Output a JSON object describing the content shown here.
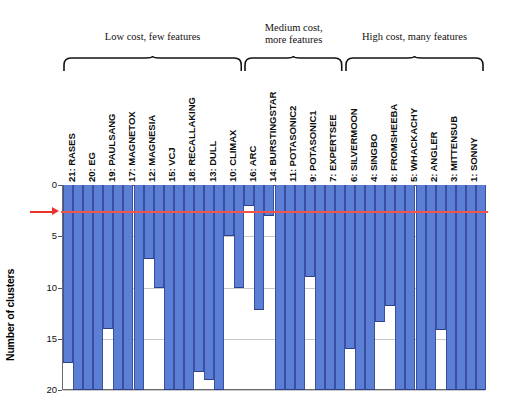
{
  "axis": {
    "y_title": "Number of clusters",
    "y_ticks": [
      "0",
      "5",
      "10",
      "15",
      "20"
    ],
    "y_min": 0,
    "y_max": 20
  },
  "groups": [
    {
      "label": "Low cost, few features",
      "start_index": 0,
      "end_index": 8
    },
    {
      "label": "Medium cost,\nmore features",
      "start_index": 9,
      "end_index": 13
    },
    {
      "label": "High cost, many features",
      "start_index": 14,
      "end_index": 20
    }
  ],
  "annotations": {
    "threshold_value": 2.5,
    "threshold_color": "#f0544a",
    "arrow_color": "#e8322a",
    "bar_color": "#5b7fd4",
    "bar_edge_color": "#3a4fa0"
  },
  "chart_data": {
    "type": "bar",
    "title": "",
    "xlabel": "",
    "ylabel": "Number of clusters",
    "ylim": [
      0,
      20
    ],
    "y_inverted": true,
    "grid": true,
    "legend": "none",
    "yticks": [
      0,
      5,
      10,
      15,
      20
    ],
    "threshold_line": 2.5,
    "categories": [
      "21: RASES",
      "20: EG",
      "19: PAULSANG",
      "17: MAGNETOX",
      "12: MAGNESIA",
      "15: VCJ",
      "18: RECALLAKING",
      "13: DULL",
      "10: CLIMAX",
      "16: ARC",
      "14: BURSTINGSTAR",
      "11: POTASONIC2",
      "9: POTASONIC1",
      "7: EXPERTSEE",
      "6: SILVERMOON",
      "4: SINGBO",
      "8: FROMSHEEBA",
      "5: WHACKACHY",
      "2: ANGLER",
      "3: MITTENSUB",
      "1: SONNY"
    ],
    "values": [
      [
        17.4,
        20.0
      ],
      [
        20.0,
        20.0
      ],
      [
        14.0,
        20.0
      ],
      [
        20.0,
        20.0
      ],
      [
        7.2,
        10.0
      ],
      [
        20.0,
        20.0
      ],
      [
        20.0,
        18.2
      ],
      [
        19.0,
        20.0
      ],
      [
        5.0,
        10.0
      ],
      [
        2.0,
        12.2
      ],
      [
        3.0,
        20.0
      ],
      [
        20.0,
        20.0
      ],
      [
        9.0,
        20.0
      ],
      [
        20.0,
        20.0
      ],
      [
        16.0,
        20.0
      ],
      [
        20.0,
        13.4
      ],
      [
        11.8,
        20.0
      ],
      [
        20.0,
        20.0
      ],
      [
        20.0,
        14.1
      ],
      [
        20.0,
        20.0
      ],
      [
        20.0,
        20.0
      ]
    ],
    "series": [
      {
        "name": "bar-a",
        "values": [
          17.4,
          20.0,
          14.0,
          20.0,
          7.2,
          20.0,
          20.0,
          19.0,
          5.0,
          2.0,
          3.0,
          20.0,
          9.0,
          20.0,
          16.0,
          20.0,
          11.8,
          20.0,
          20.0,
          20.0,
          20.0
        ]
      },
      {
        "name": "bar-b",
        "values": [
          20.0,
          20.0,
          20.0,
          20.0,
          10.0,
          20.0,
          18.2,
          20.0,
          10.0,
          12.2,
          20.0,
          20.0,
          20.0,
          20.0,
          20.0,
          13.4,
          20.0,
          20.0,
          14.1,
          20.0,
          20.0
        ]
      }
    ]
  }
}
